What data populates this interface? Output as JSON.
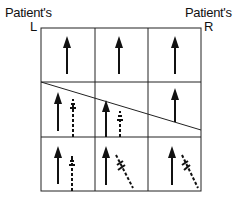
{
  "labels": {
    "left_title": "Patient's",
    "left_side": "L",
    "right_title": "Patient's",
    "right_side": "R"
  },
  "diagram": {
    "grid": {
      "rows": 3,
      "cols": 3
    },
    "diagonal_line": "slanted divider across middle row from left to right",
    "cells": [
      {
        "row": 1,
        "col": 1,
        "arrows": [
          "solid-up"
        ]
      },
      {
        "row": 1,
        "col": 2,
        "arrows": [
          "solid-up"
        ]
      },
      {
        "row": 1,
        "col": 3,
        "arrows": [
          "solid-up"
        ]
      },
      {
        "row": 2,
        "col": 1,
        "arrows": [
          "solid-up",
          "dashed-up"
        ]
      },
      {
        "row": 2,
        "col": 2,
        "arrows": [
          "solid-up",
          "dashed-up"
        ]
      },
      {
        "row": 2,
        "col": 3,
        "arrows": [
          "solid-up"
        ]
      },
      {
        "row": 3,
        "col": 1,
        "arrows": [
          "solid-up",
          "dashed-up"
        ]
      },
      {
        "row": 3,
        "col": 2,
        "arrows": [
          "solid-up",
          "dashed-diagonal"
        ]
      },
      {
        "row": 3,
        "col": 3,
        "arrows": [
          "solid-up",
          "dashed-diagonal"
        ]
      }
    ]
  }
}
